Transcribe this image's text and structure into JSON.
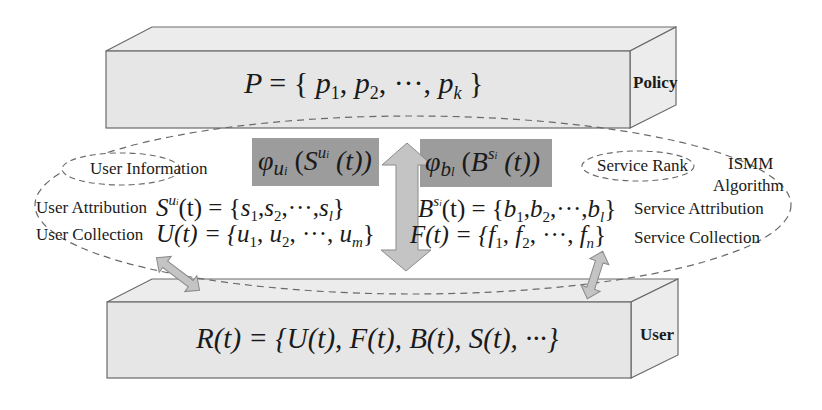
{
  "colors": {
    "box_fill": "#e6e6e6",
    "box_side": "#ececec",
    "box_stroke": "#6a6a6a",
    "highlight_fill": "#9c9c9c",
    "arrow_fill": "#c4c4c4",
    "arrow_stroke": "#8a8a8a",
    "dash_stroke": "#6a6a6a",
    "text": "#1a1a1a"
  },
  "policy_layer": {
    "label": "Policy",
    "formula": {
      "lhs": "P",
      "eq": "=",
      "open": "{",
      "items": [
        {
          "base": "p",
          "sub": "1"
        },
        {
          "base": "p",
          "sub": "2"
        },
        {
          "base": "p",
          "sub": "k"
        }
      ],
      "ellipsis": "···",
      "close": "}"
    }
  },
  "user_layer": {
    "label": "User",
    "formula": "R(t) = {U(t), F(t), B(t), S(t), ···}"
  },
  "algorithm": {
    "label_line1": "ISMM",
    "label_line2": "Algorithm"
  },
  "user_side": {
    "info_label": "User Information",
    "function_box": {
      "phi": "φ",
      "phi_sub": "u",
      "phi_subsub": "i",
      "arg": "S",
      "arg_sup": "u",
      "arg_supsub": "i",
      "tail": "(t))"
    },
    "attribution": {
      "label": "User Attribution",
      "formula": {
        "lhs": "S",
        "lhs_sup": "u",
        "lhs_supsub": "i",
        "mid": "(t) = {",
        "items": [
          "1",
          "2",
          "l"
        ],
        "base": "s",
        "ellipsis": "···",
        "close": "}"
      }
    },
    "collection": {
      "label": "User Collection",
      "formula": "U(t) = {u₁, u₂, ···, uₘ}",
      "lhs": "U(t) = {",
      "items": [
        {
          "base": "u",
          "sub": "1"
        },
        {
          "base": "u",
          "sub": "2"
        },
        {
          "base": "u",
          "sub": "m"
        }
      ],
      "ellipsis": "···",
      "close": "}"
    }
  },
  "service_side": {
    "rank_label": "Service Rank",
    "function_box": {
      "phi": "φ",
      "phi_sub": "b",
      "phi_subsub": "l",
      "arg": "B",
      "arg_sup": "s",
      "arg_supsub": "i",
      "tail": "(t))"
    },
    "attribution": {
      "label": "Service Attribution",
      "formula": {
        "lhs": "B",
        "lhs_sup": "s",
        "lhs_supsub": "i",
        "mid": "(t) = {",
        "items": [
          "1",
          "2",
          "l"
        ],
        "base": "b",
        "ellipsis": "···",
        "close": "}"
      }
    },
    "collection": {
      "label": "Service Collection",
      "formula": "F(t) = {f₁, f₂, ···, fₙ}",
      "lhs": "F(t) = {",
      "items": [
        {
          "base": "f",
          "sub": "1"
        },
        {
          "base": "f",
          "sub": "2"
        },
        {
          "base": "f",
          "sub": "n"
        }
      ],
      "ellipsis": "···",
      "close": "}"
    }
  }
}
